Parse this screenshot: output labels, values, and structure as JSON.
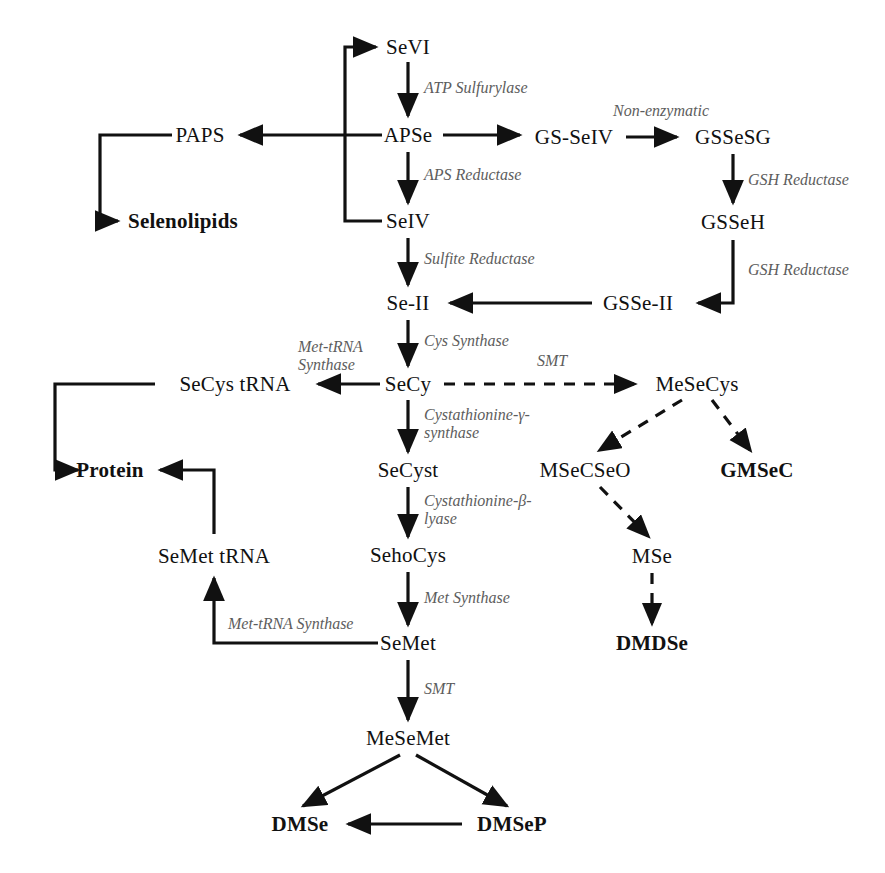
{
  "figure": {
    "line_color": "#111111",
    "enzyme_color": "#5d5d5d",
    "background": "#ffffff"
  },
  "nodes": [
    {
      "id": "sevi",
      "label": "SeVI",
      "x": 408,
      "y": 47,
      "bold": false
    },
    {
      "id": "apse",
      "label": "APSe",
      "x": 408,
      "y": 135,
      "bold": false
    },
    {
      "id": "seiv",
      "label": "SeIV",
      "x": 408,
      "y": 221,
      "bold": false
    },
    {
      "id": "se2",
      "label": "Se-II",
      "x": 408,
      "y": 303,
      "bold": false
    },
    {
      "id": "secy",
      "label": "SeCy",
      "x": 408,
      "y": 384,
      "bold": false
    },
    {
      "id": "secyst",
      "label": "SeCyst",
      "x": 408,
      "y": 470,
      "bold": false
    },
    {
      "id": "sehocys",
      "label": "SehoCys",
      "x": 408,
      "y": 555,
      "bold": false
    },
    {
      "id": "semet",
      "label": "SeMet",
      "x": 408,
      "y": 643,
      "bold": false
    },
    {
      "id": "mesemet",
      "label": "MeSeMet",
      "x": 408,
      "y": 738,
      "bold": false
    },
    {
      "id": "paps",
      "label": "PAPS",
      "x": 200,
      "y": 135,
      "bold": false
    },
    {
      "id": "selenolipids",
      "label": "Selenolipids",
      "x": 183,
      "y": 221,
      "bold": true
    },
    {
      "id": "gsseiv",
      "label": "GS-SeIV",
      "x": 574,
      "y": 137,
      "bold": false
    },
    {
      "id": "gssesg",
      "label": "GSSeSG",
      "x": 733,
      "y": 137,
      "bold": false
    },
    {
      "id": "gsseh",
      "label": "GSSeH",
      "x": 733,
      "y": 222,
      "bold": false
    },
    {
      "id": "gsse2",
      "label": "GSSe-II",
      "x": 638,
      "y": 303,
      "bold": false
    },
    {
      "id": "secystrna",
      "label": "SeCys tRNA",
      "x": 235,
      "y": 384,
      "bold": false
    },
    {
      "id": "protein",
      "label": "Protein",
      "x": 110,
      "y": 470,
      "bold": true
    },
    {
      "id": "semettrna",
      "label": "SeMet tRNA",
      "x": 214,
      "y": 556,
      "bold": false
    },
    {
      "id": "mesecys",
      "label": "MeSeCys",
      "x": 697,
      "y": 384,
      "bold": false
    },
    {
      "id": "msecseo",
      "label": "MSeCSeO",
      "x": 585,
      "y": 470,
      "bold": false
    },
    {
      "id": "gmsec",
      "label": "GMSeC",
      "x": 757,
      "y": 470,
      "bold": true
    },
    {
      "id": "mse",
      "label": "MSe",
      "x": 652,
      "y": 556,
      "bold": false
    },
    {
      "id": "dmdse",
      "label": "DMDSe",
      "x": 652,
      "y": 643,
      "bold": true
    },
    {
      "id": "dmse",
      "label": "DMSe",
      "x": 300,
      "y": 824,
      "bold": true
    },
    {
      "id": "dmsep",
      "label": "DMSeP",
      "x": 512,
      "y": 824,
      "bold": true
    }
  ],
  "enzymes": [
    {
      "id": "atp-sulfurylase",
      "label": "ATP Sulfurylase",
      "x": 424,
      "y": 88,
      "align": "left"
    },
    {
      "id": "aps-reductase",
      "label": "APS Reductase",
      "x": 424,
      "y": 175,
      "align": "left"
    },
    {
      "id": "sulfite-reductase",
      "label": "Sulfite Reductase",
      "x": 424,
      "y": 259,
      "align": "left"
    },
    {
      "id": "cys-synthase",
      "label": "Cys Synthase",
      "x": 424,
      "y": 341,
      "align": "left"
    },
    {
      "id": "cystathionine-gamma",
      "label": "Cystathionine-γ-\nsynthase",
      "x": 424,
      "y": 424,
      "align": "left"
    },
    {
      "id": "cystathionine-beta",
      "label": "Cystathionine-β-\nlyase",
      "x": 424,
      "y": 510,
      "align": "left"
    },
    {
      "id": "met-synthase",
      "label": "Met Synthase",
      "x": 424,
      "y": 598,
      "align": "left"
    },
    {
      "id": "smt-semet",
      "label": "SMT",
      "x": 424,
      "y": 689,
      "align": "left"
    },
    {
      "id": "non-enzymatic",
      "label": "Non-enzymatic",
      "x": 661,
      "y": 111,
      "align": "center"
    },
    {
      "id": "gsh-reductase-1",
      "label": "GSH Reductase",
      "x": 748,
      "y": 180,
      "align": "left"
    },
    {
      "id": "gsh-reductase-2",
      "label": "GSH Reductase",
      "x": 748,
      "y": 270,
      "align": "left"
    },
    {
      "id": "met-trna-synthase-1",
      "label": "Met-tRNA\nSynthase",
      "x": 298,
      "y": 356,
      "align": "left"
    },
    {
      "id": "smt-secy",
      "label": "SMT",
      "x": 552,
      "y": 361,
      "align": "center"
    },
    {
      "id": "met-trna-synthase-2",
      "label": "Met-tRNA Synthase",
      "x": 228,
      "y": 624,
      "align": "left"
    }
  ],
  "edges": [
    {
      "id": "sevi-apse",
      "from": "SeVI",
      "to": "APSe",
      "style": "solid"
    },
    {
      "id": "apse-seiv",
      "from": "APSe",
      "to": "SeIV",
      "style": "solid"
    },
    {
      "id": "apse-paps",
      "from": "APSe",
      "to": "PAPS",
      "style": "solid"
    },
    {
      "id": "paps-selenolipids",
      "from": "PAPS",
      "to": "Selenolipids",
      "style": "solid"
    },
    {
      "id": "seiv-sevi",
      "from": "SeIV",
      "to": "SeVI",
      "style": "solid"
    },
    {
      "id": "apse-gsseiv",
      "from": "APSe",
      "to": "GS-SeIV",
      "style": "solid"
    },
    {
      "id": "gsseiv-gssesg",
      "from": "GS-SeIV",
      "to": "GSSeSG",
      "style": "solid"
    },
    {
      "id": "gssesg-gsseh",
      "from": "GSSeSG",
      "to": "GSSeH",
      "style": "solid"
    },
    {
      "id": "gsseh-gsse2",
      "from": "GSSeH",
      "to": "GSSe-II",
      "style": "solid"
    },
    {
      "id": "gsse2-se2",
      "from": "GSSe-II",
      "to": "Se-II",
      "style": "solid"
    },
    {
      "id": "seiv-se2",
      "from": "SeIV",
      "to": "Se-II",
      "style": "solid"
    },
    {
      "id": "se2-secy",
      "from": "Se-II",
      "to": "SeCy",
      "style": "solid"
    },
    {
      "id": "secy-secystrna",
      "from": "SeCy",
      "to": "SeCys tRNA",
      "style": "solid"
    },
    {
      "id": "secystrna-protein",
      "from": "SeCys tRNA",
      "to": "Protein",
      "style": "solid"
    },
    {
      "id": "secy-mesecys",
      "from": "SeCy",
      "to": "MeSeCys",
      "style": "dashed"
    },
    {
      "id": "secy-secyst",
      "from": "SeCy",
      "to": "SeCyst",
      "style": "solid"
    },
    {
      "id": "secyst-sehocys",
      "from": "SeCyst",
      "to": "SehoCys",
      "style": "solid"
    },
    {
      "id": "sehocys-semet",
      "from": "SehoCys",
      "to": "SeMet",
      "style": "solid"
    },
    {
      "id": "semet-semettrna",
      "from": "SeMet",
      "to": "SeMet tRNA",
      "style": "solid"
    },
    {
      "id": "semettrna-protein",
      "from": "SeMet tRNA",
      "to": "Protein",
      "style": "solid"
    },
    {
      "id": "semet-mesemet",
      "from": "SeMet",
      "to": "MeSeMet",
      "style": "solid"
    },
    {
      "id": "mesemet-dmse",
      "from": "MeSeMet",
      "to": "DMSe",
      "style": "solid"
    },
    {
      "id": "mesemet-dmsep",
      "from": "MeSeMet",
      "to": "DMSeP",
      "style": "solid"
    },
    {
      "id": "dmsep-dmse",
      "from": "DMSeP",
      "to": "DMSe",
      "style": "solid"
    },
    {
      "id": "mesecys-msecseo",
      "from": "MeSeCys",
      "to": "MSeCSeO",
      "style": "dashed"
    },
    {
      "id": "mesecys-gmsec",
      "from": "MeSeCys",
      "to": "GMSeC",
      "style": "dashed"
    },
    {
      "id": "msecseo-mse",
      "from": "MSeCSeO",
      "to": "MSe",
      "style": "dashed"
    },
    {
      "id": "mse-dmdse",
      "from": "MSe",
      "to": "DMDSe",
      "style": "dashed"
    }
  ]
}
